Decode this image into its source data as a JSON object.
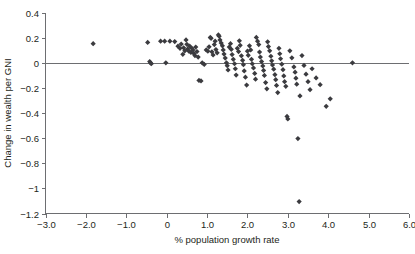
{
  "chart_data": {
    "type": "scatter",
    "title": "",
    "subtitle": "",
    "xlabel": "% population growth rate",
    "ylabel": "Change in wealth per GNI",
    "xlim": [
      -3.0,
      6.0
    ],
    "ylim": [
      -1.2,
      0.4
    ],
    "grid": false,
    "legend": null,
    "legend_position": "none",
    "marker_shape": "diamond",
    "marker_color": "#3b3b3f",
    "reference_lines": [
      {
        "axis": "y",
        "value": 0,
        "color": "#6d6e71"
      }
    ],
    "xticks": [
      -3.0,
      -2.0,
      -1.0,
      0,
      1.0,
      2.0,
      3.0,
      4.0,
      5.0,
      6.0
    ],
    "xticklabels": [
      "-3.0",
      "-2.0",
      "-1.0",
      "0",
      "1.0",
      "2.0",
      "3.0",
      "4.0",
      "5.0",
      "6.0"
    ],
    "yticks": [
      0.4,
      0.2,
      0,
      -0.2,
      -0.4,
      -0.6,
      -0.8,
      -1.0,
      -1.2
    ],
    "yticklabels": [
      "0.4",
      "0.2",
      "0",
      "-0.2",
      "-0.4",
      "-0.6",
      "-0.8",
      "-1",
      "-1.2"
    ],
    "points": [
      [
        -1.82,
        0.155
      ],
      [
        -0.47,
        0.165
      ],
      [
        -0.42,
        0.012
      ],
      [
        -0.4,
        0.002
      ],
      [
        -0.38,
        -0.005
      ],
      [
        -0.15,
        0.175
      ],
      [
        -0.05,
        0.175
      ],
      [
        -0.02,
        0.002
      ],
      [
        0.08,
        0.175
      ],
      [
        0.2,
        0.172
      ],
      [
        0.28,
        0.135
      ],
      [
        0.33,
        0.118
      ],
      [
        0.36,
        0.152
      ],
      [
        0.4,
        0.07
      ],
      [
        0.42,
        0.122
      ],
      [
        0.45,
        0.098
      ],
      [
        0.48,
        0.185
      ],
      [
        0.5,
        0.15
      ],
      [
        0.52,
        0.112
      ],
      [
        0.55,
        0.095
      ],
      [
        0.57,
        0.135
      ],
      [
        0.6,
        0.085
      ],
      [
        0.62,
        0.12
      ],
      [
        0.65,
        0.105
      ],
      [
        0.67,
        0.078
      ],
      [
        0.7,
        0.06
      ],
      [
        0.72,
        0.128
      ],
      [
        0.75,
        0.092
      ],
      [
        0.78,
        0.048
      ],
      [
        0.8,
        -0.138
      ],
      [
        0.85,
        -0.142
      ],
      [
        0.88,
        0.002
      ],
      [
        0.93,
        -0.01
      ],
      [
        0.98,
        0.105
      ],
      [
        1.02,
        0.095
      ],
      [
        1.05,
        0.13
      ],
      [
        1.08,
        0.205
      ],
      [
        1.1,
        0.198
      ],
      [
        1.12,
        0.09
      ],
      [
        1.15,
        0.065
      ],
      [
        1.18,
        0.148
      ],
      [
        1.2,
        0.175
      ],
      [
        1.22,
        0.108
      ],
      [
        1.25,
        0.082
      ],
      [
        1.28,
        0.225
      ],
      [
        1.3,
        0.215
      ],
      [
        1.32,
        0.185
      ],
      [
        1.35,
        0.16
      ],
      [
        1.38,
        0.138
      ],
      [
        1.4,
        0.105
      ],
      [
        1.42,
        0.072
      ],
      [
        1.45,
        0.04
      ],
      [
        1.48,
        0.002
      ],
      [
        1.5,
        -0.02
      ],
      [
        1.52,
        -0.055
      ],
      [
        1.55,
        0.128
      ],
      [
        1.58,
        0.155
      ],
      [
        1.6,
        0.11
      ],
      [
        1.62,
        0.068
      ],
      [
        1.65,
        0.03
      ],
      [
        1.68,
        -0.005
      ],
      [
        1.7,
        -0.045
      ],
      [
        1.72,
        -0.095
      ],
      [
        1.75,
        0.118
      ],
      [
        1.78,
        0.092
      ],
      [
        1.8,
        0.178
      ],
      [
        1.82,
        0.142
      ],
      [
        1.85,
        0.058
      ],
      [
        1.88,
        0.022
      ],
      [
        1.9,
        -0.012
      ],
      [
        1.92,
        -0.062
      ],
      [
        1.95,
        -0.112
      ],
      [
        1.98,
        -0.175
      ],
      [
        2.0,
        0.095
      ],
      [
        2.02,
        0.062
      ],
      [
        2.05,
        0.138
      ],
      [
        2.08,
        0.105
      ],
      [
        2.1,
        0.03
      ],
      [
        2.12,
        -0.005
      ],
      [
        2.15,
        -0.038
      ],
      [
        2.18,
        -0.082
      ],
      [
        2.2,
        -0.128
      ],
      [
        2.22,
        0.205
      ],
      [
        2.25,
        0.175
      ],
      [
        2.28,
        0.148
      ],
      [
        2.3,
        0.088
      ],
      [
        2.32,
        0.048
      ],
      [
        2.35,
        0.012
      ],
      [
        2.38,
        -0.022
      ],
      [
        2.4,
        -0.058
      ],
      [
        2.42,
        -0.098
      ],
      [
        2.45,
        -0.155
      ],
      [
        2.48,
        -0.205
      ],
      [
        2.5,
        0.17
      ],
      [
        2.52,
        0.132
      ],
      [
        2.55,
        0.098
      ],
      [
        2.58,
        0.055
      ],
      [
        2.6,
        0.018
      ],
      [
        2.62,
        -0.015
      ],
      [
        2.65,
        -0.048
      ],
      [
        2.68,
        -0.092
      ],
      [
        2.7,
        -0.132
      ],
      [
        2.72,
        -0.178
      ],
      [
        2.75,
        -0.235
      ],
      [
        2.78,
        0.118
      ],
      [
        2.8,
        0.075
      ],
      [
        2.82,
        0.035
      ],
      [
        2.85,
        -0.008
      ],
      [
        2.88,
        -0.052
      ],
      [
        2.9,
        -0.102
      ],
      [
        2.92,
        -0.148
      ],
      [
        2.95,
        -0.185
      ],
      [
        2.98,
        -0.425
      ],
      [
        3.0,
        -0.445
      ],
      [
        3.05,
        0.098
      ],
      [
        3.1,
        0.042
      ],
      [
        3.15,
        -0.03
      ],
      [
        3.18,
        -0.072
      ],
      [
        3.2,
        -0.12
      ],
      [
        3.22,
        -0.168
      ],
      [
        3.25,
        -0.602
      ],
      [
        3.28,
        -1.105
      ],
      [
        3.3,
        -0.262
      ],
      [
        3.35,
        0.06
      ],
      [
        3.4,
        -0.018
      ],
      [
        3.45,
        -0.088
      ],
      [
        3.5,
        -0.148
      ],
      [
        3.55,
        -0.212
      ],
      [
        3.6,
        -0.045
      ],
      [
        3.7,
        -0.118
      ],
      [
        3.8,
        -0.172
      ],
      [
        3.95,
        -0.345
      ],
      [
        4.05,
        -0.285
      ],
      [
        4.6,
        0.002
      ]
    ]
  }
}
